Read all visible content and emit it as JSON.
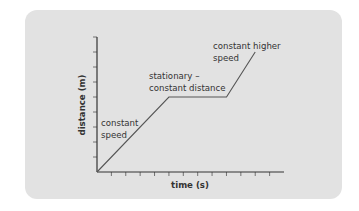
{
  "chart_data": {
    "type": "line",
    "title": "",
    "xlabel": "time (s)",
    "ylabel": "distance (m)",
    "x_ticks": 13,
    "y_ticks": 9,
    "xlim": [
      0,
      13
    ],
    "ylim": [
      0,
      9
    ],
    "grid": false,
    "series": [
      {
        "name": "distance-time",
        "points": [
          [
            0,
            0
          ],
          [
            5,
            5
          ],
          [
            9,
            5
          ],
          [
            11,
            8
          ]
        ]
      }
    ],
    "annotations": [
      {
        "text": "constant speed",
        "lines": [
          "constant",
          "speed"
        ],
        "segment": 1
      },
      {
        "text": "stationary – constant distance",
        "lines": [
          "stationary –",
          "constant distance"
        ],
        "segment": 2
      },
      {
        "text": "constant higher speed",
        "lines": [
          "constant higher",
          "speed"
        ],
        "segment": 3
      }
    ]
  },
  "labels": {
    "xlabel": "time (s)",
    "ylabel": "distance (m)",
    "ann1_l1": "constant",
    "ann1_l2": "speed",
    "ann2_l1": "stationary –",
    "ann2_l2": "constant distance",
    "ann3_l1": "constant higher",
    "ann3_l2": "speed"
  },
  "colors": {
    "card": "#e2e2e2",
    "line": "#444444",
    "text": "#333333"
  }
}
